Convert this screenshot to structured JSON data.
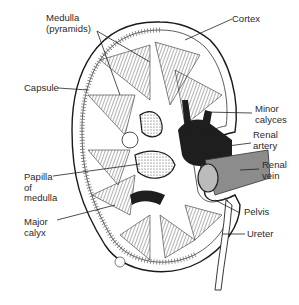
{
  "diagram": {
    "labels": {
      "medulla": "Medulla\n(pyramids)",
      "cortex": "Cortex",
      "capsule": "Capsule",
      "minor_calyces": "Minor\ncalyces",
      "renal_artery": "Renal\nartery",
      "renal_vein": "Renal\nvein",
      "papilla": "Papilla\nof\nmedulla",
      "major_calyx": "Major\ncalyx",
      "pelvis": "Pelvis",
      "ureter": "Ureter"
    },
    "colors": {
      "outline": "#1a1a1a",
      "vessel_dark": "#1e1e1e",
      "vein_gray": "#8c8c8c",
      "background": "#ffffff"
    }
  }
}
